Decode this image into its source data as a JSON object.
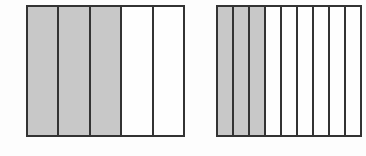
{
  "diagram": {
    "type": "fraction-bar-models",
    "fill_colors": {
      "shaded": "#c8c8c8",
      "unshaded": "#fefefe",
      "border": "#333333"
    },
    "bars": [
      {
        "id": "left",
        "total_parts": 5,
        "shaded_parts": 3,
        "fraction": "3/5"
      },
      {
        "id": "right",
        "total_parts": 10,
        "shaded_parts": 3,
        "fraction": "3/10",
        "note": "right edge cropped by image boundary"
      }
    ]
  }
}
